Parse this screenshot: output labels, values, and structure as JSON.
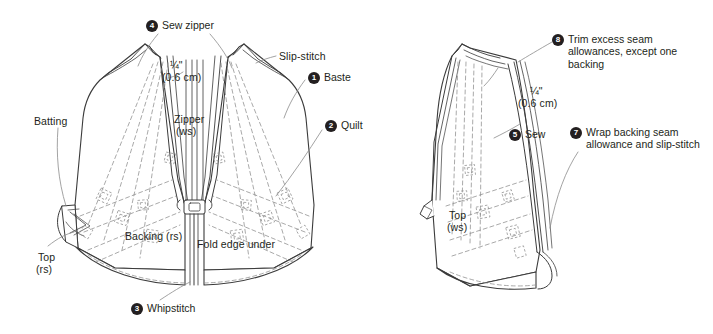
{
  "diagram": {
    "colors": {
      "ink": "#231f20",
      "line": "#3b3b3b",
      "dashed": "#8c8c8c",
      "badge_bg": "#231f20",
      "badge_text": "#ffffff",
      "background": "#ffffff"
    },
    "left_panel": {
      "name": "open-zipper-assembly",
      "steps": [
        {
          "number": "4",
          "label": "Sew zipper"
        },
        {
          "number": "1",
          "label": "Baste"
        },
        {
          "number": "2",
          "label": "Quilt"
        },
        {
          "number": "3",
          "label": "Whipstitch"
        }
      ],
      "annotations": [
        {
          "name": "seam-allowance",
          "line1": "¼\"",
          "line2": "(0.6 cm)"
        },
        {
          "name": "slip-stitch",
          "text": "Slip-stitch"
        },
        {
          "name": "batting",
          "text": "Batting"
        },
        {
          "name": "zipper",
          "line1": "Zipper",
          "line2": "(ws)"
        },
        {
          "name": "top-rs",
          "line1": "Top",
          "line2": "(rs)"
        },
        {
          "name": "backing-rs",
          "text": "Backing (rs)"
        },
        {
          "name": "fold-edge-under",
          "text": "Fold edge under"
        }
      ]
    },
    "right_panel": {
      "name": "folded-seam-assembly",
      "steps": [
        {
          "number": "8",
          "label": "Trim excess seam allowances, except one backing"
        },
        {
          "number": "5",
          "label": "Sew"
        },
        {
          "number": "7",
          "label": "Wrap backing seam allowance and slip-stitch"
        }
      ],
      "annotations": [
        {
          "name": "seam-allowance",
          "line1": "¼\"",
          "line2": "(0.6 cm)"
        },
        {
          "name": "top-ws",
          "line1": "Top",
          "line2": "(ws)"
        }
      ]
    }
  }
}
